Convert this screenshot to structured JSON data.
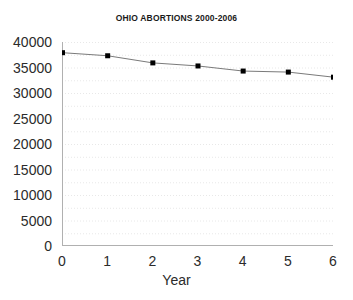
{
  "chart_data": {
    "type": "line",
    "title": "OHIO ABORTIONS 2000-2006",
    "xlabel": "Year",
    "ylabel": "",
    "x": [
      0,
      1,
      2,
      3,
      4,
      5,
      6
    ],
    "values": [
      38000,
      37400,
      36000,
      35400,
      34400,
      34200,
      33200
    ],
    "series": [
      {
        "name": "Ohio abortions",
        "values": [
          38000,
          37400,
          36000,
          35400,
          34400,
          34200,
          33200
        ]
      }
    ],
    "xlim": [
      0,
      6
    ],
    "ylim": [
      0,
      40000
    ],
    "xticks": [
      "0",
      "1",
      "2",
      "3",
      "4",
      "5",
      "6"
    ],
    "yticks": [
      "0",
      "5000",
      "10000",
      "15000",
      "20000",
      "25000",
      "30000",
      "35000",
      "40000"
    ],
    "ytick_values": [
      0,
      5000,
      10000,
      15000,
      20000,
      25000,
      30000,
      35000,
      40000
    ],
    "grid": "horizontal-dotted",
    "grid_interval": 2500,
    "legend": "none",
    "marker": "square",
    "marker_color": "#000000",
    "line_color": "#7a7a7a",
    "grid_color": "#e8e8e8",
    "axis_color": "#b0b0b0",
    "background_color": "#ffffff"
  }
}
